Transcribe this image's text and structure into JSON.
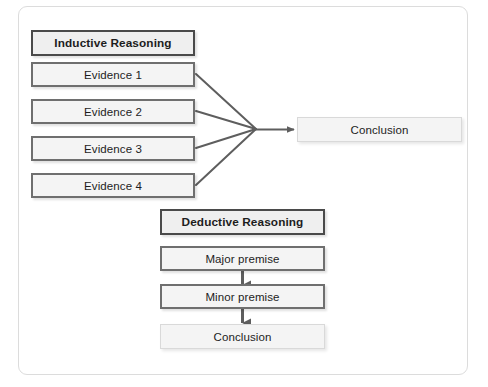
{
  "diagram": {
    "title_visible": false,
    "frame": {
      "name": "diagram-frame",
      "border_color": "#dcdcdc"
    },
    "colors": {
      "box_fill": "#f4f4f4",
      "box_border_strong": "#6f6f6f",
      "box_border_header": "#4a4a4a",
      "box_border_light": "#d9d9d9",
      "connector": "#5e5e5e",
      "text": "#1d1d1d",
      "frame_border": "#dcdcdc",
      "page_background": "#ffffff"
    },
    "inductive": {
      "header": "Inductive Reasoning",
      "evidence": [
        "Evidence 1",
        "Evidence 2",
        "Evidence 3",
        "Evidence 4"
      ],
      "conclusion": "Conclusion"
    },
    "deductive": {
      "header": "Deductive Reasoning",
      "steps": [
        "Major premise",
        "Minor premise"
      ],
      "conclusion": "Conclusion"
    }
  }
}
